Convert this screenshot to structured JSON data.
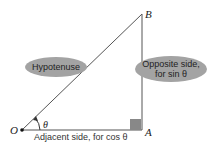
{
  "diagram": {
    "points": {
      "O": "O",
      "A": "A",
      "B": "B"
    },
    "angle_label": "θ",
    "labels": {
      "hypotenuse": "Hypotenuse",
      "opposite_line1": "Opposite side,",
      "opposite_line2": "for sin θ",
      "adjacent": "Adjacent side, for cos θ"
    },
    "colors": {
      "ellipse": "#a3a3a3",
      "line": "#555555",
      "right_angle": "#888888"
    }
  }
}
